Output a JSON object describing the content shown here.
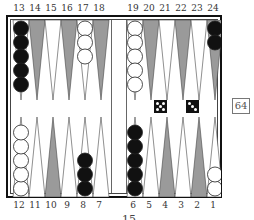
{
  "game": "backgammon",
  "top_labels": [
    "13",
    "14",
    "15",
    "16",
    "17",
    "18",
    "19",
    "20",
    "21",
    "22",
    "23",
    "24"
  ],
  "bottom_labels": [
    "12",
    "11",
    "10",
    "9",
    "8",
    "7",
    "6",
    "5",
    "4",
    "3",
    "2",
    "1"
  ],
  "colors": {
    "dark_point": "#9a9a9a",
    "light_point": "#ffffff",
    "black_checker": "#111111",
    "white_checker": "#ffffff",
    "frame": "#111111"
  },
  "checkers": [
    {
      "point": 13,
      "color": "black",
      "count": 5
    },
    {
      "point": 17,
      "color": "white",
      "count": 3
    },
    {
      "point": 19,
      "color": "white",
      "count": 5
    },
    {
      "point": 24,
      "color": "black",
      "count": 2
    },
    {
      "point": 12,
      "color": "white",
      "count": 5
    },
    {
      "point": 8,
      "color": "black",
      "count": 3
    },
    {
      "point": 6,
      "color": "black",
      "count": 5
    },
    {
      "point": 1,
      "color": "white",
      "count": 2
    }
  ],
  "dice": [
    5,
    3
  ],
  "cube": {
    "value": "64"
  },
  "bottom_text": "15"
}
